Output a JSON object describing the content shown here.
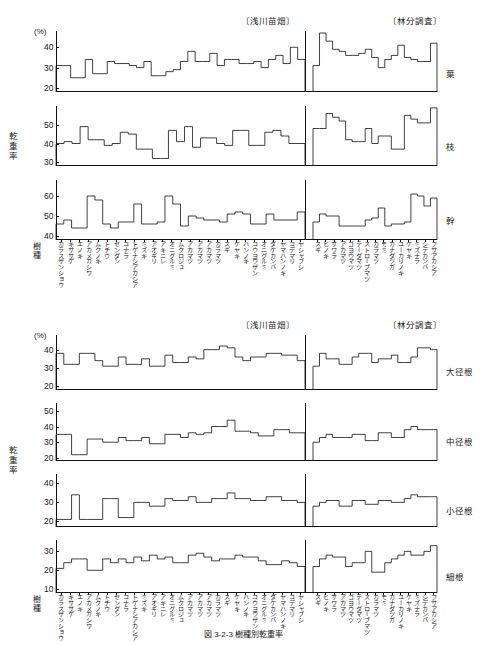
{
  "units": {
    "percent": "(%)"
  },
  "headers": {
    "left_group": "〔浅川苗畑〕",
    "right_group": "〔林分調査〕"
  },
  "axes": {
    "y_label": "乾重率",
    "x_label": "樹種"
  },
  "caption": "図 3-2-3  樹種別乾重率",
  "species_left": [
    "カラスザンショウ",
    "キササゲ",
    "エノキ",
    "アカメガシワ",
    "ムクノキ",
    "トチウ",
    "センダン",
    "コナラ",
    "トゲナシアカシア",
    "ミズキ",
    "アオギリ",
    "アキニレ",
    "オニグルミ",
    "ムクロジュ",
    "アカマツ",
    "アカマツ",
    "アカマツ",
    "カラマツ",
    "スギ",
    "ケヤキ",
    "ハンノキ",
    "コウヨウザン",
    "オニグルミ",
    "ダケカンバ",
    "ヤマハンノキ",
    "コデマリ",
    "ヤシャブシ"
  ],
  "species_right": [
    "スギ",
    "ヒノキ",
    "サワラ",
    "アカマツ",
    "ゴヨウマツ",
    "テーダマツ",
    "ストローブマツ",
    "カラマツ",
    "モミ",
    "カナダツガ",
    "ユーカリノキ",
    "ケヤキ",
    "ミズナラ",
    "シデカンバ",
    "フサアカシア"
  ],
  "chart_data": [
    {
      "type": "line",
      "id": "leaf",
      "panel_label": "葉",
      "group": "upper",
      "ylabel": "乾重率",
      "xlabel": "樹種",
      "unit": "(%)",
      "ylim": [
        18,
        48
      ],
      "yticks": [
        20,
        30,
        40
      ],
      "grid": false,
      "left_values": [
        31,
        31,
        25,
        25,
        34,
        27,
        27,
        33,
        32,
        32,
        31,
        30,
        33,
        26,
        26,
        28,
        29,
        33,
        38,
        33,
        33,
        37,
        31,
        34,
        34,
        32,
        32,
        33,
        30,
        34,
        36,
        32,
        40,
        34
      ],
      "right_values": [
        31,
        47,
        43,
        39,
        38,
        36,
        36,
        37,
        39,
        35,
        30,
        34,
        36,
        41,
        35,
        34,
        33,
        33,
        42
      ]
    },
    {
      "type": "line",
      "id": "branch",
      "panel_label": "枝",
      "group": "upper",
      "ylabel": "乾重率",
      "xlabel": "樹種",
      "ylim": [
        28,
        60
      ],
      "yticks": [
        30,
        40,
        50
      ],
      "grid": false,
      "left_values": [
        40,
        41,
        40,
        49,
        42,
        42,
        39,
        40,
        46,
        45,
        37,
        37,
        32,
        32,
        47,
        41,
        49,
        38,
        43,
        43,
        40,
        39,
        47,
        47,
        39,
        39,
        46,
        47,
        44,
        40,
        40
      ],
      "right_values": [
        48,
        48,
        56,
        54,
        52,
        42,
        41,
        41,
        48,
        40,
        44,
        44,
        37,
        37,
        55,
        53,
        51,
        51,
        59
      ]
    },
    {
      "type": "line",
      "id": "trunk",
      "panel_label": "幹",
      "group": "upper",
      "ylabel": "乾重率",
      "xlabel": "樹種",
      "ylim": [
        38,
        68
      ],
      "yticks": [
        40,
        50,
        60
      ],
      "grid": false,
      "left_values": [
        46,
        48,
        44,
        44,
        60,
        58,
        46,
        44,
        47,
        47,
        56,
        46,
        46,
        47,
        60,
        56,
        45,
        50,
        49,
        48,
        48,
        47,
        51,
        52,
        51,
        46,
        46,
        51,
        48,
        48,
        48,
        52
      ],
      "right_values": [
        47,
        51,
        50,
        50,
        45,
        45,
        45,
        45,
        48,
        49,
        54,
        45,
        46,
        46,
        47,
        61,
        60,
        55,
        59
      ]
    },
    {
      "type": "line",
      "id": "large-root",
      "panel_label": "大径根",
      "group": "lower",
      "ylabel": "乾重率",
      "xlabel": "樹種",
      "unit": "(%)",
      "ylim": [
        18,
        48
      ],
      "yticks": [
        20,
        30,
        40
      ],
      "grid": false,
      "left_values": [
        38,
        32,
        32,
        38,
        38,
        34,
        31,
        31,
        36,
        32,
        32,
        35,
        31,
        31,
        37,
        33,
        33,
        36,
        35,
        40,
        40,
        42,
        41,
        36,
        34,
        36,
        36,
        38,
        38,
        37,
        37,
        34
      ],
      "right_values": [
        31,
        38,
        35,
        35,
        32,
        32,
        36,
        38,
        38,
        33,
        35,
        35,
        37,
        33,
        33,
        36,
        41,
        41,
        40
      ]
    },
    {
      "type": "line",
      "id": "medium-root",
      "panel_label": "中径根",
      "group": "lower",
      "ylabel": "乾重率",
      "xlabel": "樹種",
      "ylim": [
        18,
        55
      ],
      "yticks": [
        20,
        30,
        40,
        50
      ],
      "grid": false,
      "left_values": [
        35,
        35,
        22,
        22,
        32,
        32,
        30,
        30,
        33,
        31,
        31,
        33,
        29,
        29,
        35,
        35,
        33,
        36,
        35,
        36,
        40,
        40,
        44,
        37,
        37,
        36,
        34,
        34,
        38,
        38,
        36,
        36
      ],
      "right_values": [
        30,
        33,
        35,
        33,
        33,
        33,
        35,
        35,
        31,
        31,
        36,
        36,
        33,
        33,
        38,
        40,
        38,
        38,
        38
      ]
    },
    {
      "type": "line",
      "id": "small-root",
      "panel_label": "小径根",
      "group": "lower",
      "ylabel": "乾重率",
      "xlabel": "樹種",
      "ylim": [
        17,
        45
      ],
      "yticks": [
        20,
        30,
        40
      ],
      "grid": false,
      "left_values": [
        21,
        21,
        34,
        21,
        21,
        21,
        32,
        32,
        22,
        22,
        30,
        30,
        28,
        28,
        32,
        31,
        31,
        33,
        30,
        30,
        32,
        32,
        35,
        32,
        32,
        31,
        31,
        33,
        33,
        31,
        31,
        30
      ],
      "right_values": [
        28,
        30,
        31,
        31,
        28,
        28,
        31,
        31,
        29,
        29,
        31,
        31,
        30,
        30,
        32,
        34,
        33,
        33,
        33
      ]
    },
    {
      "type": "line",
      "id": "fine-root",
      "panel_label": "細根",
      "group": "lower",
      "ylabel": "乾重率",
      "xlabel": "樹種",
      "ylim": [
        8,
        36
      ],
      "yticks": [
        10,
        20,
        30
      ],
      "grid": false,
      "left_values": [
        21,
        24,
        26,
        26,
        20,
        20,
        26,
        24,
        26,
        24,
        27,
        25,
        28,
        26,
        27,
        24,
        24,
        28,
        29,
        27,
        25,
        26,
        26,
        28,
        27,
        27,
        25,
        23,
        23,
        25,
        24,
        22
      ],
      "right_values": [
        22,
        26,
        28,
        27,
        27,
        22,
        24,
        24,
        30,
        19,
        19,
        24,
        26,
        28,
        30,
        28,
        28,
        30,
        33
      ]
    }
  ]
}
